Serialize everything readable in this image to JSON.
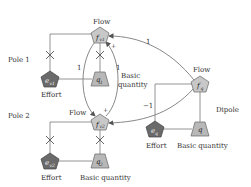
{
  "diagram": {
    "type": "bond-graph-style flow/effort/basic-quantity diagram",
    "colors": {
      "pentagon_light": "#c8c8c8",
      "pentagon_dark": "#6a6a6a",
      "trapezoid": "#b8b8b8",
      "line": "#7a7a7a",
      "text": "#333333"
    },
    "labels": {
      "pole1": "Pole 1",
      "pole2": "Pole 2",
      "dipole": "Dipole",
      "flow_v1": "Flow",
      "flow_v2": "Flow",
      "flow_q": "Flow",
      "effort_v1": "Effort",
      "effort_v2": "Effort",
      "effort_q": "Effort",
      "basic_quantity_1a": "Basic",
      "basic_quantity_1b": "quantity",
      "basic_quantity_2": "Basic quantity",
      "basic_quantity_q": "Basic quantity",
      "coef_left": "1",
      "coef_right": "1",
      "coef_top": "1",
      "coef_bottom": "−1",
      "plus_top": "+",
      "plus_bottom": "+"
    },
    "nodes": {
      "f_v1": {
        "main": "f",
        "sub": "v1"
      },
      "e_v1": {
        "main": "e",
        "sub": "v1"
      },
      "q1": {
        "main": "q",
        "sub": "1"
      },
      "f_v2": {
        "main": "f",
        "sub": "v2"
      },
      "e_v2": {
        "main": "e",
        "sub": "v2"
      },
      "q2": {
        "main": "q",
        "sub": "2"
      },
      "f_q": {
        "main": "f",
        "sub": "q"
      },
      "e_q": {
        "main": "e",
        "sub": "q"
      },
      "q": {
        "main": "q",
        "sub": ""
      }
    }
  }
}
